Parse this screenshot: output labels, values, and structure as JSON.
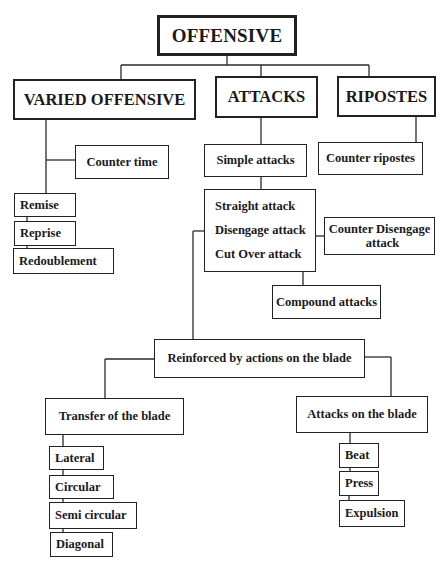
{
  "diagram": {
    "root": {
      "label": "OFFENSIVE"
    },
    "branches": {
      "varied_offensive": {
        "label": "VARIED OFFENSIVE",
        "children": {
          "counter_time": "Counter time",
          "remise": "Remise",
          "reprise": "Reprise",
          "redoublement": "Redoublement"
        }
      },
      "attacks": {
        "label": "ATTACKS",
        "simple_attacks": "Simple attacks",
        "simple_types": [
          "Straight attack",
          "Disengage attack",
          "Cut Over attack"
        ],
        "counter_disengage": [
          "Counter Disengage",
          "attack"
        ],
        "compound_attacks": "Compound attacks",
        "reinforced": {
          "label": "Reinforced by actions on the blade",
          "transfer": {
            "label": "Transfer of the blade",
            "items": [
              "Lateral",
              "Circular",
              "Semi circular",
              "Diagonal"
            ]
          },
          "attacks_on_blade": {
            "label": "Attacks on the blade",
            "items": [
              "Beat",
              "Press",
              "Expulsion"
            ]
          }
        }
      },
      "ripostes": {
        "label": "RIPOSTES",
        "children": {
          "counter_ripostes": "Counter ripostes"
        }
      }
    }
  }
}
